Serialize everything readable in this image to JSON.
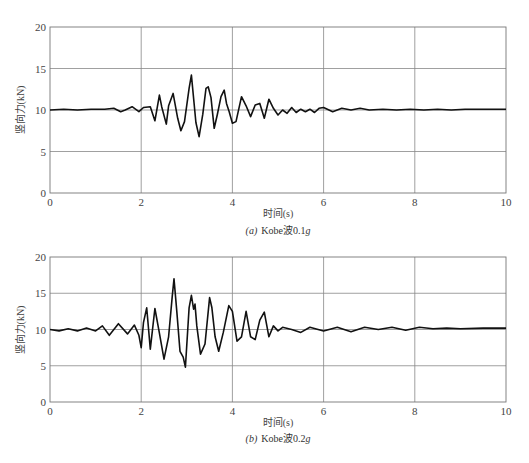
{
  "chart_data": [
    {
      "type": "line",
      "title": "",
      "caption_prefix": "(a)",
      "caption": "Kobe波0.1g",
      "xlabel": "时间(s)",
      "ylabel": "竖向力(kN)",
      "xlim": [
        0,
        10
      ],
      "ylim": [
        0,
        20
      ],
      "xticks": [
        0,
        2,
        4,
        6,
        8,
        10
      ],
      "yticks": [
        0,
        5,
        10,
        15,
        20
      ],
      "grid": true,
      "series": [
        {
          "name": "Kobe 0.1g vertical force",
          "x": [
            0,
            0.3,
            0.6,
            0.9,
            1.2,
            1.4,
            1.55,
            1.65,
            1.8,
            1.95,
            2.05,
            2.2,
            2.3,
            2.4,
            2.45,
            2.55,
            2.6,
            2.7,
            2.8,
            2.87,
            2.95,
            3.05,
            3.1,
            3.2,
            3.27,
            3.35,
            3.42,
            3.47,
            3.53,
            3.6,
            3.67,
            3.75,
            3.82,
            3.87,
            3.93,
            4.0,
            4.08,
            4.2,
            4.3,
            4.4,
            4.5,
            4.6,
            4.7,
            4.8,
            4.9,
            5.0,
            5.1,
            5.2,
            5.3,
            5.4,
            5.5,
            5.6,
            5.7,
            5.8,
            5.9,
            6.0,
            6.2,
            6.4,
            6.6,
            6.8,
            7.0,
            7.3,
            7.6,
            7.9,
            8.2,
            8.5,
            8.8,
            9.1,
            9.4,
            9.7,
            10.0
          ],
          "y": [
            10.0,
            10.1,
            10.0,
            10.1,
            10.1,
            10.2,
            9.8,
            10.0,
            10.4,
            9.8,
            10.3,
            10.4,
            8.7,
            11.8,
            10.4,
            8.3,
            10.5,
            12.0,
            9.0,
            7.5,
            8.6,
            12.6,
            14.2,
            8.5,
            6.8,
            9.5,
            12.6,
            12.8,
            11.5,
            7.8,
            9.5,
            11.6,
            12.4,
            10.8,
            9.8,
            8.4,
            8.6,
            11.6,
            10.5,
            9.2,
            10.6,
            10.8,
            9.0,
            11.3,
            10.2,
            9.4,
            10.0,
            9.6,
            10.3,
            9.7,
            10.1,
            9.8,
            10.1,
            9.7,
            10.2,
            10.3,
            9.8,
            10.2,
            10.0,
            10.2,
            10.0,
            10.1,
            10.0,
            10.1,
            10.0,
            10.1,
            10.0,
            10.1,
            10.1,
            10.1,
            10.1
          ]
        }
      ]
    },
    {
      "type": "line",
      "title": "",
      "caption_prefix": "(b)",
      "caption": "Kobe波0.2g",
      "xlabel": "时间(s)",
      "ylabel": "竖向力(kN)",
      "xlim": [
        0,
        10
      ],
      "ylim": [
        0,
        20
      ],
      "xticks": [
        0,
        2,
        4,
        6,
        8,
        10
      ],
      "yticks": [
        0,
        5,
        10,
        15,
        20
      ],
      "grid": true,
      "series": [
        {
          "name": "Kobe 0.2g vertical force",
          "x": [
            0,
            0.2,
            0.4,
            0.6,
            0.8,
            1.0,
            1.15,
            1.3,
            1.5,
            1.7,
            1.85,
            1.95,
            2.0,
            2.05,
            2.12,
            2.2,
            2.3,
            2.4,
            2.5,
            2.6,
            2.68,
            2.72,
            2.78,
            2.85,
            2.92,
            2.97,
            3.05,
            3.1,
            3.15,
            3.18,
            3.22,
            3.3,
            3.4,
            3.5,
            3.55,
            3.62,
            3.7,
            3.8,
            3.92,
            4.0,
            4.1,
            4.2,
            4.3,
            4.4,
            4.5,
            4.6,
            4.7,
            4.8,
            4.9,
            5.0,
            5.1,
            5.3,
            5.5,
            5.7,
            6.0,
            6.3,
            6.6,
            6.9,
            7.2,
            7.5,
            7.8,
            8.1,
            8.4,
            8.7,
            9.0,
            9.5,
            10.0
          ],
          "y": [
            10.0,
            9.8,
            10.1,
            9.8,
            10.2,
            9.8,
            10.5,
            9.2,
            10.8,
            9.4,
            10.6,
            9.2,
            7.5,
            11.0,
            13.0,
            7.3,
            12.9,
            9.5,
            5.9,
            9.0,
            14.5,
            17.0,
            12.5,
            7.0,
            6.2,
            4.8,
            13.0,
            14.7,
            12.8,
            13.5,
            10.5,
            6.6,
            8.0,
            14.4,
            13.0,
            9.0,
            7.0,
            9.6,
            13.3,
            12.5,
            8.4,
            9.0,
            12.5,
            9.0,
            8.6,
            11.3,
            12.4,
            9.0,
            10.5,
            9.8,
            10.3,
            10.0,
            9.6,
            10.3,
            9.8,
            10.3,
            9.7,
            10.3,
            10.0,
            10.3,
            9.9,
            10.3,
            10.1,
            10.2,
            10.1,
            10.2,
            10.2
          ]
        }
      ]
    }
  ],
  "plots": [
    {
      "caption_prefix": "(a)",
      "caption_text": "Kobe波0.1",
      "caption_g": "g",
      "xlabel": "时间(s)",
      "ylabel": "竖向力(kN)"
    },
    {
      "caption_prefix": "(b)",
      "caption_text": "Kobe波0.2",
      "caption_g": "g",
      "xlabel": "时间(s)",
      "ylabel": "竖向力(kN)"
    }
  ],
  "colors": {
    "trace": "#111111",
    "grid": "#888888",
    "frame": "#777777",
    "text": "#444444"
  }
}
